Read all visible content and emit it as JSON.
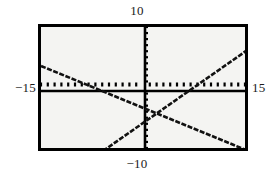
{
  "graph": {
    "title": "",
    "window": {
      "xmin_label": "−15",
      "xmax_label": "15",
      "ymax_label": "10",
      "ymin_label": "−10"
    }
  },
  "chart_data": {
    "type": "line",
    "title": "",
    "xlabel": "",
    "ylabel": "",
    "xlim": [
      -15,
      15
    ],
    "ylim": [
      -10,
      10
    ],
    "grid": false,
    "legend": "none",
    "axis_style": "tick-marked-axes",
    "x_tick_interval": 1,
    "y_tick_interval": 1,
    "x_tick_labels": [
      "−15",
      "15"
    ],
    "y_tick_labels": [
      "−10",
      "10"
    ],
    "annotations": [
      {
        "text": "10",
        "position": "above-top-center"
      },
      {
        "text": "−10",
        "position": "below-bottom-center"
      },
      {
        "text": "−15",
        "position": "left-of-axis"
      },
      {
        "text": "15",
        "position": "right-of-axis"
      }
    ],
    "series": [
      {
        "name": "descending-line",
        "style": "dashed-thick-black",
        "slope": -0.6,
        "intercept": -2.0,
        "x": [
          -15,
          15
        ],
        "y": [
          7.0,
          -11.0
        ],
        "x_axis_intercept": -3.3,
        "endpoints_px": [
          [
            0,
            39
          ],
          [
            205,
            123
          ]
        ]
      },
      {
        "name": "ascending-line",
        "style": "dashed-thick-black",
        "slope": 0.8,
        "intercept": -3.3,
        "x": [
          -15,
          15
        ],
        "y": [
          -15.3,
          8.7
        ],
        "x_axis_intercept": 4.1,
        "endpoints_px": [
          [
            62,
            124
          ],
          [
            205,
            24
          ]
        ]
      }
    ],
    "intersection": {
      "x": -0.9,
      "y": -1.4,
      "px": [
        114,
        86
      ]
    }
  }
}
